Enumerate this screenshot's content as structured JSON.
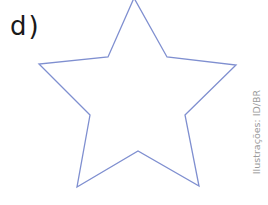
{
  "item": {
    "label": "d)"
  },
  "figure": {
    "shape": "five-pointed-star-outline",
    "stroke_color": "#7f8fd0",
    "fill": "none",
    "vertices": [
      [
        134,
        -2
      ],
      [
        167,
        57
      ],
      [
        236,
        65
      ],
      [
        185,
        115
      ],
      [
        199,
        186
      ],
      [
        138,
        151
      ],
      [
        77,
        187
      ],
      [
        90,
        115
      ],
      [
        39,
        64
      ],
      [
        108,
        57
      ]
    ]
  },
  "credit": {
    "text": "Ilustrações: ID/BR"
  }
}
